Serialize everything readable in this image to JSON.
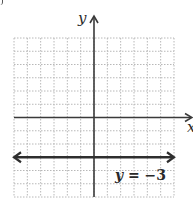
{
  "chart_data": {
    "type": "line",
    "title": "",
    "xlabel": "x",
    "ylabel": "y",
    "xlim": [
      -6,
      6
    ],
    "ylim": [
      -6,
      6
    ],
    "grid": true,
    "grid_style": "dotted",
    "axis_arrows": true,
    "series": [
      {
        "name": "y = -3",
        "kind": "horizontal_line",
        "y": -3,
        "x": [
          -6,
          6
        ],
        "values": [
          -3,
          -3
        ],
        "arrows_both_ends": true,
        "annotation": "y = −3"
      }
    ]
  },
  "labels": {
    "x_axis": "x",
    "y_axis": "y",
    "equation_var": "y",
    "equation_rest": " = −3"
  },
  "colors": {
    "grid": "#b8b8b8",
    "axis": "#3a3a3a",
    "line": "#2e2e2e",
    "background": "#ffffff"
  }
}
